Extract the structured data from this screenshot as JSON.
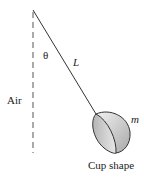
{
  "diagram": {
    "labels": {
      "theta": "θ",
      "length": "L",
      "medium": "Air",
      "mass": "m",
      "caption": "Cup shape"
    },
    "colors": {
      "line": "#333333",
      "cup_light": "#e6e6e6",
      "cup_dark": "#9a9a9a"
    }
  }
}
